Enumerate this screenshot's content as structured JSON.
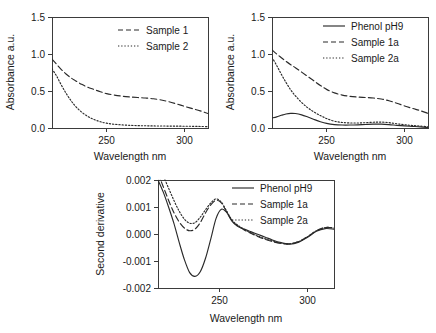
{
  "figure": {
    "background": "#ffffff",
    "line_color": "#2a2a2a",
    "axis_color": "#3b3b3b"
  },
  "chart_data": [
    {
      "id": "panel_a",
      "type": "line",
      "title": "",
      "xlabel": "Wavelength nm",
      "ylabel": "Absorbance a.u.",
      "xlim": [
        215,
        315
      ],
      "ylim": [
        0.0,
        1.5
      ],
      "xticks": [
        250,
        300
      ],
      "xticklabels": [
        "250",
        "300"
      ],
      "yticks": [
        0.0,
        0.5,
        1.0,
        1.5
      ],
      "yticklabels": [
        "0.0",
        "0.5",
        "1.0",
        "1.5"
      ],
      "grid": false,
      "legend_position": "upper right",
      "x": [
        215,
        218,
        221,
        224,
        227,
        230,
        234,
        238,
        242,
        246,
        250,
        255,
        260,
        265,
        270,
        275,
        280,
        285,
        290,
        295,
        300,
        305,
        310,
        315
      ],
      "series": [
        {
          "name": "Sample 1",
          "style": "dashed",
          "values": [
            0.93,
            0.86,
            0.79,
            0.73,
            0.68,
            0.64,
            0.59,
            0.55,
            0.52,
            0.49,
            0.465,
            0.445,
            0.43,
            0.42,
            0.412,
            0.405,
            0.395,
            0.378,
            0.355,
            0.325,
            0.292,
            0.262,
            0.232,
            0.195
          ]
        },
        {
          "name": "Sample 2",
          "style": "dotted",
          "values": [
            0.8,
            0.7,
            0.58,
            0.47,
            0.375,
            0.295,
            0.215,
            0.155,
            0.115,
            0.085,
            0.065,
            0.05,
            0.042,
            0.036,
            0.032,
            0.03,
            0.028,
            0.027,
            0.026,
            0.025,
            0.024,
            0.023,
            0.021,
            0.018
          ]
        }
      ]
    },
    {
      "id": "panel_b",
      "type": "line",
      "title": "",
      "xlabel": "Wavelength nm",
      "ylabel": "Absorbance a.u.",
      "xlim": [
        215,
        315
      ],
      "ylim": [
        0.0,
        1.5
      ],
      "xticks": [
        250,
        300
      ],
      "xticklabels": [
        "250",
        "300"
      ],
      "yticks": [
        0.0,
        0.5,
        1.0,
        1.5
      ],
      "yticklabels": [
        "0.0",
        "0.5",
        "1.0",
        "1.5"
      ],
      "grid": false,
      "legend_position": "upper right",
      "x": [
        215,
        218,
        221,
        224,
        227,
        230,
        234,
        238,
        242,
        246,
        250,
        255,
        260,
        265,
        270,
        275,
        280,
        285,
        290,
        295,
        300,
        305,
        310,
        315
      ],
      "series": [
        {
          "name": "Phenol pH9",
          "style": "solid",
          "values": [
            0.135,
            0.15,
            0.172,
            0.19,
            0.198,
            0.196,
            0.178,
            0.148,
            0.115,
            0.085,
            0.062,
            0.046,
            0.04,
            0.04,
            0.043,
            0.048,
            0.052,
            0.052,
            0.046,
            0.036,
            0.028,
            0.022,
            0.016,
            0.008
          ]
        },
        {
          "name": "Sample 1a",
          "style": "dashed",
          "values": [
            1.055,
            1.0,
            0.95,
            0.9,
            0.855,
            0.815,
            0.755,
            0.695,
            0.635,
            0.575,
            0.522,
            0.475,
            0.445,
            0.428,
            0.418,
            0.412,
            0.405,
            0.392,
            0.368,
            0.335,
            0.298,
            0.265,
            0.235,
            0.198
          ]
        },
        {
          "name": "Sample 2a",
          "style": "dotted",
          "values": [
            0.955,
            0.845,
            0.725,
            0.615,
            0.515,
            0.435,
            0.345,
            0.272,
            0.215,
            0.168,
            0.128,
            0.092,
            0.075,
            0.068,
            0.068,
            0.072,
            0.078,
            0.08,
            0.072,
            0.058,
            0.044,
            0.034,
            0.026,
            0.016
          ]
        }
      ]
    },
    {
      "id": "panel_c",
      "type": "line",
      "title": "",
      "xlabel": "Wavelength nm",
      "ylabel": "Second derivative",
      "xlim": [
        215,
        315
      ],
      "ylim": [
        -0.002,
        0.002
      ],
      "xticks": [
        250,
        300
      ],
      "xticklabels": [
        "250",
        "300"
      ],
      "yticks": [
        -0.002,
        -0.001,
        0.0,
        0.001,
        0.002
      ],
      "yticklabels": [
        "-0.002",
        "-0.001",
        "0.000",
        "0.001",
        "0.002"
      ],
      "grid": false,
      "legend_position": "upper right",
      "x": [
        215,
        218,
        221,
        224,
        227,
        230,
        233,
        236,
        239,
        242,
        245,
        248,
        251,
        254,
        257,
        260,
        264,
        268,
        272,
        276,
        280,
        285,
        290,
        295,
        300,
        305,
        310,
        315
      ],
      "series": [
        {
          "name": "Phenol pH9",
          "style": "solid",
          "values": [
            0.002,
            0.00155,
            0.001,
            0.0004,
            -0.0003,
            -0.00095,
            -0.00143,
            -0.00157,
            -0.0014,
            -0.0009,
            -0.00018,
            0.00058,
            0.00092,
            0.0008,
            0.00048,
            0.0003,
            0.00018,
            8e-05,
            -2e-05,
            -0.00012,
            -0.00022,
            -0.00032,
            -0.00038,
            -0.0003,
            -0.00012,
            0.0001,
            0.0002,
            0.00018
          ]
        },
        {
          "name": "Sample 1a",
          "style": "dashed",
          "values": [
            0.00225,
            0.00175,
            0.00125,
            0.0008,
            0.00045,
            0.00022,
            0.00012,
            0.00018,
            0.00042,
            0.00078,
            0.00108,
            0.00125,
            0.00115,
            0.00082,
            0.0005,
            0.00032,
            0.00015,
            2e-05,
            -0.0001,
            -0.0002,
            -0.00028,
            -0.00035,
            -0.00036,
            -0.00028,
            -0.0001,
            0.00012,
            0.00024,
            0.00022
          ]
        },
        {
          "name": "Sample 2a",
          "style": "dotted",
          "values": [
            0.00255,
            0.00215,
            0.0017,
            0.00125,
            0.00085,
            0.00055,
            0.0004,
            0.00042,
            0.00062,
            0.0009,
            0.00115,
            0.0013,
            0.00118,
            0.00085,
            0.00052,
            0.00034,
            0.00017,
            4e-05,
            -8e-05,
            -0.00018,
            -0.00026,
            -0.00034,
            -0.00036,
            -0.00028,
            -0.0001,
            0.00012,
            0.00024,
            0.00022
          ]
        }
      ]
    }
  ]
}
